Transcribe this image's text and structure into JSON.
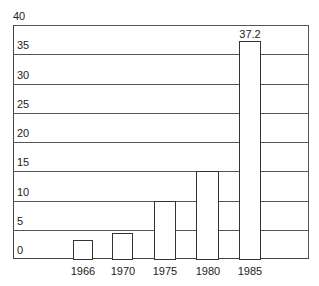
{
  "chart_data": {
    "type": "bar",
    "title": "",
    "xlabel": "",
    "ylabel": "",
    "categories": [
      "1966",
      "1970",
      "1975",
      "1980",
      "1985"
    ],
    "values": [
      3.2,
      4.4,
      10,
      15,
      37.2
    ],
    "data_labels": {
      "1985": "37.2"
    },
    "ylim": [
      0,
      40
    ],
    "yticks": [
      "0",
      "5",
      "10",
      "15",
      "20",
      "25",
      "30",
      "35",
      "40"
    ],
    "grid": true,
    "legend": null
  },
  "colors": {
    "bar_fill": "#ffffff",
    "bar_edge": "#333333",
    "grid": "#555555"
  }
}
